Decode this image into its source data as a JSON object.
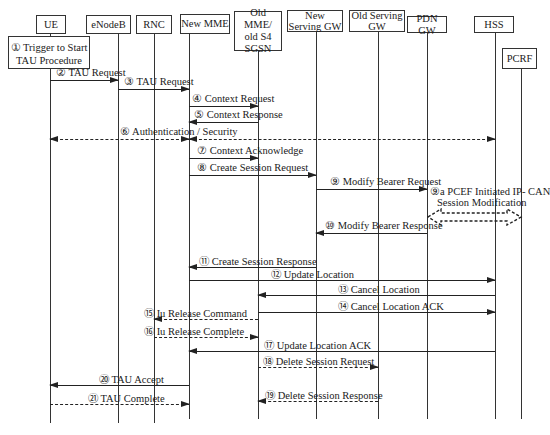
{
  "diagram": {
    "type": "sequence-diagram",
    "entities": [
      {
        "id": "ue",
        "label": "UE"
      },
      {
        "id": "enodeb",
        "label": "eNodeB"
      },
      {
        "id": "rnc",
        "label": "RNC"
      },
      {
        "id": "new_mme",
        "label": "New MME"
      },
      {
        "id": "old_mme",
        "label": "Old MME/ old S4 SGSN"
      },
      {
        "id": "new_sgw",
        "label": "New Serving GW"
      },
      {
        "id": "old_sgw",
        "label": "Old Serving GW"
      },
      {
        "id": "pdn_gw",
        "label": "PDN GW"
      },
      {
        "id": "hss",
        "label": "HSS"
      },
      {
        "id": "pcrf",
        "label": "PCRF"
      }
    ],
    "note_trigger": "① Trigger to Start TAU Procedure",
    "messages": [
      {
        "n": "②",
        "label": "② TAU Request",
        "from": "ue",
        "to": "enodeb",
        "style": "solid"
      },
      {
        "n": "③",
        "label": "③ TAU Request",
        "from": "enodeb",
        "to": "new_mme",
        "style": "solid"
      },
      {
        "n": "④",
        "label": "④ Context Request",
        "from": "new_mme",
        "to": "old_mme",
        "style": "solid"
      },
      {
        "n": "⑤",
        "label": "⑤ Context Response",
        "from": "old_mme",
        "to": "new_mme",
        "style": "solid"
      },
      {
        "n": "⑥",
        "label": "⑥ Authentication / Security",
        "from": "new_mme",
        "to": "ue,hss",
        "style": "dashed-bidirectional"
      },
      {
        "n": "⑦",
        "label": "⑦ Context Acknowledge",
        "from": "new_mme",
        "to": "old_mme",
        "style": "solid"
      },
      {
        "n": "⑧",
        "label": "⑧ Create Session Request",
        "from": "new_mme",
        "to": "new_sgw",
        "style": "solid"
      },
      {
        "n": "⑨",
        "label": "⑨ Modify Bearer Request",
        "from": "new_sgw",
        "to": "pdn_gw",
        "style": "solid"
      },
      {
        "n": "9a",
        "label": "⑨a PCEF Initiated IP- CAN",
        "label2": "Session Modification",
        "from": "pdn_gw",
        "to": "pcrf",
        "style": "dashed-block-bidirectional"
      },
      {
        "n": "⑩",
        "label": "⑩ Modify Bearer Response",
        "from": "pdn_gw",
        "to": "new_sgw",
        "style": "solid"
      },
      {
        "n": "⑪",
        "label": "⑪ Create Session Response",
        "from": "new_sgw",
        "to": "new_mme",
        "style": "solid"
      },
      {
        "n": "⑫",
        "label": "⑫ Update Location",
        "from": "new_mme",
        "to": "hss",
        "style": "solid"
      },
      {
        "n": "⑬",
        "label": "⑬ Cancel Location",
        "from": "hss",
        "to": "old_mme",
        "style": "solid"
      },
      {
        "n": "⑭",
        "label": "⑭ Cancel Location ACK",
        "from": "old_mme",
        "to": "hss",
        "style": "solid"
      },
      {
        "n": "⑮",
        "label": "⑮ Iu Release Command",
        "from": "old_mme",
        "to": "rnc",
        "style": "dashed"
      },
      {
        "n": "⑯",
        "label": "⑯ Iu Release Complete",
        "from": "rnc",
        "to": "old_mme",
        "style": "dashed"
      },
      {
        "n": "⑰",
        "label": "⑰ Update Location ACK",
        "from": "hss",
        "to": "new_mme",
        "style": "solid"
      },
      {
        "n": "⑱",
        "label": "⑱ Delete Session Request",
        "from": "old_mme",
        "to": "old_sgw",
        "style": "dashed"
      },
      {
        "n": "⑳",
        "label": "⑳ TAU Accept",
        "from": "new_mme",
        "to": "ue",
        "style": "solid"
      },
      {
        "n": "⑲",
        "label": "⑲ Delete Session Response",
        "from": "old_sgw",
        "to": "old_mme",
        "style": "dashed"
      },
      {
        "n": "㉑",
        "label": "㉑ TAU Complete",
        "from": "ue",
        "to": "new_mme",
        "style": "dashed"
      }
    ]
  }
}
